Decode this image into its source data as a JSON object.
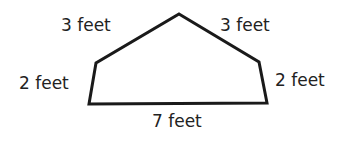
{
  "diagram": {
    "shape": "pentagon",
    "stroke_color": "#1a1a1a",
    "text_color": "#222222",
    "vertices": [
      [
        179,
        14
      ],
      [
        259,
        62
      ],
      [
        267,
        103
      ],
      [
        89,
        104
      ],
      [
        96,
        63
      ]
    ],
    "labels": {
      "top_left": "3 feet",
      "top_right": "3 feet",
      "left": "2 feet",
      "right": "2 feet",
      "bottom": "7 feet"
    }
  }
}
